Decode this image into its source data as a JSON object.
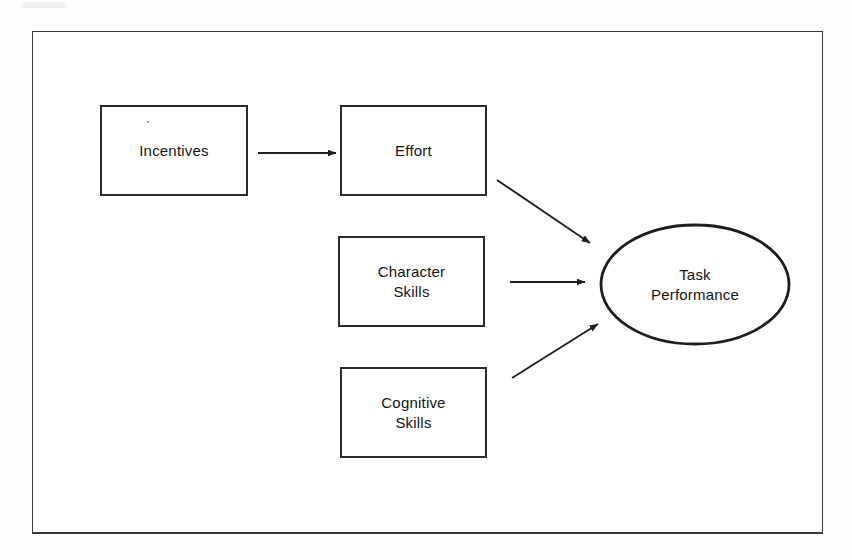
{
  "figure": {
    "type": "conceptual-flow-diagram",
    "background_color": "#ffffff",
    "stroke_color": "#2b2b2b",
    "frame_color": "#3a3a3a"
  },
  "nodes": [
    {
      "id": "incentives",
      "label": "Incentives",
      "shape": "rectangle",
      "x": 100,
      "y": 105,
      "width": 148,
      "height": 91
    },
    {
      "id": "effort",
      "label": "Effort",
      "shape": "rectangle",
      "x": 340,
      "y": 105,
      "width": 147,
      "height": 91
    },
    {
      "id": "character_skills",
      "label": "Character\nSkills",
      "shape": "rectangle",
      "x": 338,
      "y": 236,
      "width": 147,
      "height": 91
    },
    {
      "id": "cognitive_skills",
      "label": "Cognitive\nSkills",
      "shape": "rectangle",
      "x": 340,
      "y": 367,
      "width": 147,
      "height": 91
    },
    {
      "id": "task_performance",
      "label": "Task\nPerformance",
      "shape": "ellipse",
      "x": 600,
      "y": 224,
      "width": 190,
      "height": 121
    }
  ],
  "edges": [
    {
      "id": "incentives-to-effort",
      "from": "incentives",
      "to": "effort",
      "style": "straight-arrow",
      "direction": "horizontal-right",
      "x1": 258,
      "y1": 153,
      "x2": 336,
      "y2": 153
    },
    {
      "id": "effort-to-task-performance",
      "from": "effort",
      "to": "task_performance",
      "style": "straight-arrow",
      "direction": "diagonal-down-right",
      "x1": 497,
      "y1": 180,
      "x2": 592,
      "y2": 244
    },
    {
      "id": "character-skills-to-task-performance",
      "from": "character_skills",
      "to": "task_performance",
      "style": "straight-arrow",
      "direction": "horizontal-right",
      "x1": 510,
      "y1": 282,
      "x2": 586,
      "y2": 282
    },
    {
      "id": "cognitive-skills-to-task-performance",
      "from": "cognitive_skills",
      "to": "task_performance",
      "style": "straight-arrow",
      "direction": "diagonal-up-right",
      "x1": 512,
      "y1": 378,
      "x2": 600,
      "y2": 323
    }
  ],
  "frame": {
    "x": 32,
    "y": 31,
    "width": 791,
    "height": 503
  }
}
